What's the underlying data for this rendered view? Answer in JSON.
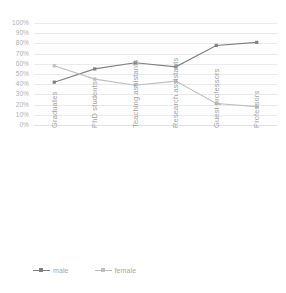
{
  "chart_data": {
    "type": "line",
    "title": "",
    "subtitle": "",
    "xlabel": "",
    "ylabel": "",
    "categories": [
      "Graduates",
      "PhD students",
      "Teaching assistants",
      "Research assistants",
      "Guest professors",
      "Professors"
    ],
    "series": [
      {
        "name": "male",
        "color": "#808080",
        "values": [
          42,
          55,
          61,
          57,
          78,
          81
        ]
      },
      {
        "name": "female",
        "color": "#bfbfbf",
        "values": [
          58,
          45,
          39,
          43,
          21,
          18
        ]
      }
    ],
    "ylim": [
      0,
      100
    ],
    "ytick_labels": [
      "100%",
      "90%",
      "80%",
      "70%",
      "60%",
      "50%",
      "40%",
      "30%",
      "20%",
      "10%",
      "0%"
    ],
    "ytick_values": [
      100,
      90,
      80,
      70,
      60,
      50,
      40,
      30,
      20,
      10,
      0
    ],
    "value_suffix": "%",
    "grid": true,
    "grid_axis": "y",
    "legend_position": "bottom-left",
    "legend": [
      "male",
      "female"
    ],
    "marker": "square",
    "x_tick_label_rotation": -90
  },
  "colors": {
    "male": "#808080",
    "female": "#bfbfbf",
    "gridline": "#ebebeb",
    "baseline": "#e2e2e2",
    "axis_text": "#b0b0b0",
    "legend_text": "#a8a8a8",
    "background": "#ffffff"
  }
}
